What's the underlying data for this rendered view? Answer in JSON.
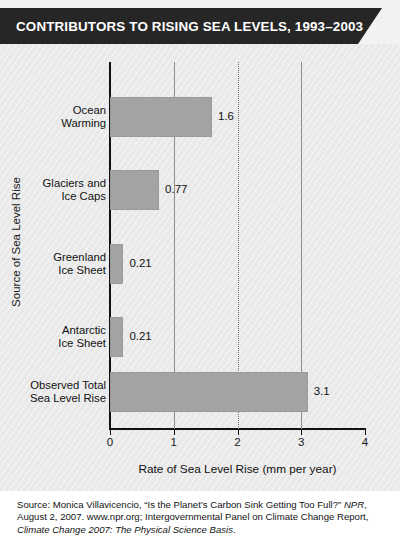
{
  "header": {
    "title": "CONTRIBUTORS TO RISING SEA LEVELS, 1993–2003",
    "banner_color": "#262626",
    "text_color": "#ffffff"
  },
  "chart_data": {
    "type": "bar",
    "orientation": "horizontal",
    "title": "CONTRIBUTORS TO RISING SEA LEVELS, 1993–2003",
    "categories": [
      "Ocean\nWarming",
      "Glaciers and\nIce Caps",
      "Greenland\nIce Sheet",
      "Antarctic\nIce Sheet",
      "Observed Total\nSea Level Rise"
    ],
    "values": [
      1.6,
      0.77,
      0.21,
      0.21,
      3.1
    ],
    "value_labels": [
      "1.6",
      "0.77",
      "0.21",
      "0.21",
      "3.1"
    ],
    "xlabel": "Rate of Sea Level Rise (mm per year)",
    "ylabel": "Source of Sea Level Rise",
    "xlim": [
      0,
      4
    ],
    "xticks": [
      0,
      1,
      2,
      3,
      4
    ],
    "xtick_labels": [
      "0",
      "1",
      "2",
      "3",
      "4"
    ],
    "grid": true,
    "gridlines": [
      1,
      2,
      3
    ],
    "legend": null,
    "bar_color": "#a3a3a3",
    "plot_background": "#e9e9e9"
  },
  "footer": {
    "line1_plain_a": "Source: Monica Villavicencio, “Is the Planet’s Carbon Sink Getting Too Full?” ",
    "line1_italic": "NPR",
    "line1_plain_b": ", August 2, 2007. www.npr.org; Intergovernmental Panel on Climate Change Report, ",
    "line2_italic": "Climate Change 2007: The Physical Science Basis",
    "line2_plain": "."
  }
}
